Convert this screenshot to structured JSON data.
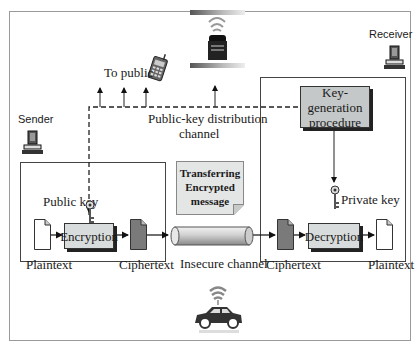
{
  "diagram": {
    "type": "public-key-cryptography-flow",
    "sender": {
      "label": "Sender",
      "public_key_label": "Public key",
      "plaintext_label": "Plaintext",
      "encryption_label": "Encryption",
      "ciphertext_label": "Ciphertext"
    },
    "receiver": {
      "label": "Receiver",
      "keygen_line1": "Key-generation",
      "keygen_line2": "procedure",
      "private_key_label": "Private key",
      "ciphertext_label": "Ciphertext",
      "decryption_label": "Decryption",
      "plaintext_label": "Plaintext"
    },
    "channel": {
      "insecure_label": "Insecure channel",
      "note_line1": "Transferring",
      "note_line2": "Encrypted",
      "note_line3": "message",
      "distribution_line1": "Public-key distribution",
      "distribution_line2": "channel",
      "to_public_label": "To public"
    },
    "icons": [
      "computer-icon",
      "key-icon",
      "document-icon",
      "phone-icon",
      "roadside-unit-icon",
      "car-icon",
      "wifi-icon",
      "pipe-icon"
    ],
    "colors": {
      "process_box": "#d8dcdc",
      "keygen_box": "#c4c8c8",
      "ciphertext_doc": "#7a7a7a",
      "border": "#444444"
    }
  }
}
